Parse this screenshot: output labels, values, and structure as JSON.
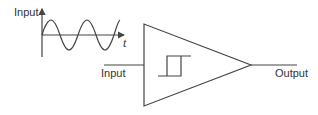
{
  "diagram": {
    "waveform": {
      "y_axis_label": "Input",
      "x_axis_label": "t",
      "signal": "sine",
      "cycles": 3
    },
    "block": {
      "shape": "triangle",
      "symbol": "hysteresis-loop"
    },
    "input_label": "Input",
    "output_label": "Output",
    "colors": {
      "line": "#444444",
      "text": "#333333",
      "background": "#ffffff"
    }
  }
}
